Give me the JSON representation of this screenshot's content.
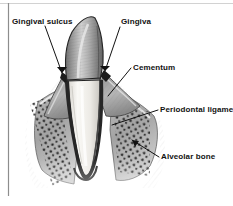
{
  "figure": {
    "kind": "anatomical-illustration",
    "style": "grayscale-pen-and-ink",
    "background_color": "#ffffff",
    "text_color": "#111111",
    "border": {
      "left_rule_color": "#8d8d8d",
      "top_rule_color": "#cfcfcf"
    }
  },
  "labels": {
    "gingival_sulcus": "Gingival sulcus",
    "gingiva": "Gingiva",
    "cementum": "Cementum",
    "periodontal_ligament": "Periodontal ligamer",
    "alveolar_bone": "Alveolar bone"
  },
  "leader_lines": [
    {
      "name": "gingival-sulcus-leader",
      "from": [
        44,
        26
      ],
      "to": [
        63,
        74
      ],
      "arrow": true
    },
    {
      "name": "gingiva-leader",
      "from": [
        120,
        27
      ],
      "to": [
        104,
        72
      ],
      "arrow": true
    },
    {
      "name": "cementum-leader",
      "from": [
        131,
        68
      ],
      "to": [
        108,
        95
      ],
      "arrow": false
    },
    {
      "name": "periodontal-ligament-leader",
      "from": [
        158,
        110
      ],
      "to": [
        112,
        124
      ],
      "arrow": false
    },
    {
      "name": "alveolar-bone-leader",
      "from": [
        159,
        157
      ],
      "to": [
        133,
        140
      ],
      "arrow": true
    }
  ],
  "structures": {
    "crown": {
      "name": "enamel-crown",
      "fill": "#b4b4b4",
      "outline": "#2a2a2a"
    },
    "root": {
      "name": "tooth-root",
      "fill": "#f2f0ec",
      "outline": "#3a3a3a"
    },
    "gingiva_tissue": {
      "name": "gingiva-tissue",
      "fill": "#9c9c9c"
    },
    "periodontal_ligament": {
      "name": "periodontal-ligament-space",
      "fill": "#2e2e2e"
    },
    "alveolar_bone": {
      "name": "alveolar-bone-trabeculae",
      "fill": "#a9a9a9",
      "dot_color": "#262626"
    }
  }
}
